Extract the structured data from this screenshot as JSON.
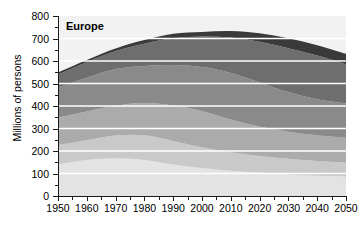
{
  "chart_data": {
    "type": "area",
    "title": "Europe",
    "xlabel": "",
    "ylabel": "Millions of persons",
    "x": [
      1950,
      1960,
      1970,
      1980,
      1990,
      2000,
      2010,
      2020,
      2030,
      2040,
      2050
    ],
    "xlim": [
      1950,
      2050
    ],
    "ylim": [
      0,
      800
    ],
    "ytick_labels": [
      "0",
      "100",
      "200",
      "300",
      "400",
      "500",
      "600",
      "700",
      "800"
    ],
    "ytick_values": [
      0,
      100,
      200,
      300,
      400,
      500,
      600,
      700,
      800
    ],
    "xtick_labels": [
      "1950",
      "1960",
      "1970",
      "1980",
      "1990",
      "2000",
      "2010",
      "2020",
      "2030",
      "2040",
      "2050"
    ],
    "grid": "horizontal-white",
    "legend_position": "none",
    "stacked": true,
    "total": [
      549,
      605,
      656,
      693,
      721,
      729,
      733,
      723,
      701,
      670,
      632
    ],
    "series": [
      {
        "name": "0-14",
        "color": "#e3e3e3",
        "values": [
          141,
          160,
          168,
          160,
          140,
          124,
          112,
          104,
          96,
          90,
          86
        ]
      },
      {
        "name": "15-24",
        "color": "#c9c9c9",
        "values": [
          86,
          88,
          101,
          110,
          105,
          93,
          82,
          74,
          70,
          66,
          63
        ]
      },
      {
        "name": "25-39",
        "color": "#ababab",
        "values": [
          122,
          128,
          132,
          143,
          157,
          161,
          146,
          131,
          120,
          114,
          110
        ]
      },
      {
        "name": "40-59",
        "color": "#8a8a8a",
        "values": [
          134,
          150,
          163,
          165,
          180,
          195,
          207,
          196,
          176,
          160,
          152
        ]
      },
      {
        "name": "60-79",
        "color": "#6e6e6e",
        "values": [
          58,
          69,
          80,
          99,
          119,
          136,
          157,
          181,
          195,
          194,
          174
        ]
      },
      {
        "name": "80+",
        "color": "#3a3a3a",
        "values": [
          8,
          10,
          12,
          16,
          20,
          20,
          29,
          37,
          44,
          46,
          47
        ]
      }
    ]
  },
  "axes": {
    "y_title": "Millions of persons"
  },
  "panel": {
    "title": "Europe"
  },
  "colors": {
    "plot_background": "#f2f2f2",
    "gridline": "#ffffff",
    "axis": "#1a1a1a",
    "text": "#000000"
  }
}
